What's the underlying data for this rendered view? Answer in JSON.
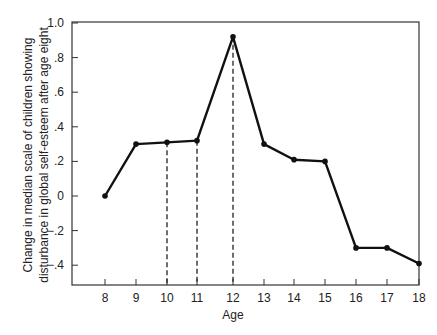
{
  "chart_data": {
    "type": "line",
    "title": "",
    "xlabel": "Age",
    "ylabel_lines": [
      "Change in median scale of children showing",
      "disturbance in global self-esteem after age eight"
    ],
    "ylabel": "Change in median scale of children showing disturbance in global self-esteem after age eight",
    "x": [
      8,
      9,
      10,
      11,
      12,
      13,
      14,
      15,
      16,
      17,
      18
    ],
    "x_tick_labels": [
      "8",
      "9",
      "10",
      "11",
      "12",
      "13",
      "14",
      "15",
      "16",
      "17",
      "18"
    ],
    "values": [
      0.0,
      0.3,
      0.31,
      0.32,
      0.92,
      0.3,
      0.21,
      0.2,
      -0.3,
      -0.3,
      -0.39
    ],
    "y_ticks": [
      1.0,
      0.8,
      0.6,
      0.4,
      0.2,
      0.0,
      -0.2,
      -0.4
    ],
    "y_tick_labels": [
      "1.0",
      ".8",
      ".6",
      ".4",
      ".2",
      "0",
      "−.2",
      "−.4"
    ],
    "ylim": [
      -0.48,
      1.0
    ],
    "xlim": [
      7.1,
      18
    ],
    "dashed_drop_lines_at": [
      10,
      11,
      12
    ],
    "grid": false,
    "legend": null,
    "line_color": "#111111",
    "marker": "filled-circle"
  }
}
